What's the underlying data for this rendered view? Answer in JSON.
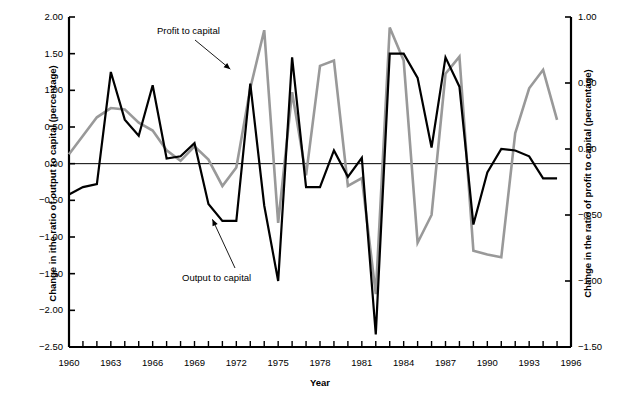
{
  "chart_data": {
    "type": "line",
    "title": "",
    "xlabel": "Year",
    "ylabel_left": "Change in ithe ratio of output to capital (percentage)",
    "ylabel_right": "Change in the ratio of profit to capital (percentage)",
    "x": [
      1960,
      1961,
      1962,
      1963,
      1964,
      1965,
      1966,
      1967,
      1968,
      1969,
      1970,
      1971,
      1972,
      1973,
      1974,
      1975,
      1976,
      1977,
      1978,
      1979,
      1980,
      1981,
      1982,
      1983,
      1984,
      1985,
      1986,
      1987,
      1988,
      1989,
      1990,
      1991,
      1992,
      1993,
      1994,
      1995
    ],
    "xlim": [
      1960,
      1996
    ],
    "xticks": [
      1960,
      1961,
      1962,
      1963,
      1964,
      1965,
      1966,
      1967,
      1968,
      1969,
      1970,
      1971,
      1972,
      1973,
      1974,
      1975,
      1976,
      1977,
      1978,
      1979,
      1980,
      1981,
      1982,
      1983,
      1984,
      1985,
      1986,
      1987,
      1988,
      1989,
      1990,
      1991,
      1992,
      1993,
      1994,
      1995,
      1996
    ],
    "xtick_labels": [
      "1960",
      "1963",
      "1966",
      "1969",
      "1972",
      "1975",
      "1978",
      "1981",
      "1984",
      "1987",
      "1990",
      "1993",
      "1996"
    ],
    "xtick_label_years": [
      1960,
      1963,
      1966,
      1969,
      1972,
      1975,
      1978,
      1981,
      1984,
      1987,
      1990,
      1993,
      1996
    ],
    "ylim_left": [
      -2.5,
      2.0
    ],
    "yticks_left": [
      2.0,
      1.5,
      1.0,
      0.5,
      0.0,
      -0.5,
      -1.0,
      -1.5,
      -2.0,
      -2.5
    ],
    "ytick_labels_left": [
      "2.00",
      "1.50",
      "1.00",
      "0.50",
      "0.00",
      "−0.50",
      "−1.00",
      "−1.50",
      "−2.00",
      "−2.50"
    ],
    "ylim_right": [
      -1.5,
      1.0
    ],
    "yticks_right": [
      1.0,
      0.5,
      0.0,
      -0.5,
      -1.0,
      -1.5
    ],
    "ytick_labels_right": [
      "1.00",
      "0.50",
      "0.00",
      "−0.50",
      "−1.00",
      "−1.50"
    ],
    "grid": false,
    "zero_line": true,
    "legend_position": "inline-annotations",
    "series": [
      {
        "name": "Output to capital",
        "axis": "left",
        "color": "#000000",
        "linewidth": 2.2,
        "values": [
          -0.42,
          -0.32,
          -0.28,
          1.25,
          0.6,
          0.38,
          1.07,
          0.07,
          0.1,
          0.28,
          -0.55,
          -0.78,
          -0.78,
          1.09,
          -0.57,
          -1.6,
          1.45,
          -0.32,
          -0.32,
          0.18,
          -0.18,
          0.08,
          -2.33,
          1.5,
          1.5,
          1.17,
          0.22,
          1.45,
          1.05,
          -0.83,
          -0.12,
          0.2,
          0.18,
          0.1,
          -0.2,
          -0.2
        ]
      },
      {
        "name": "Profit to capital",
        "axis": "right",
        "color": "#999999",
        "linewidth": 2.6,
        "values": [
          -0.04,
          0.1,
          0.24,
          0.31,
          0.3,
          0.2,
          0.14,
          -0.01,
          -0.09,
          0.02,
          -0.08,
          -0.28,
          -0.14,
          0.46,
          0.9,
          -0.56,
          0.43,
          -0.2,
          0.63,
          0.67,
          -0.28,
          -0.22,
          -1.1,
          0.92,
          0.67,
          -0.71,
          -0.5,
          0.57,
          0.7,
          -0.77,
          -0.8,
          -0.82,
          0.12,
          0.46,
          0.6,
          0.22
        ]
      }
    ],
    "annotations": [
      {
        "name": "Profit to capital",
        "text": "Profit to capital",
        "points_to_year": 1972,
        "points_to_value": 0.62
      },
      {
        "name": "Output to capital",
        "text": "Output to capital",
        "points_to_year": 1970,
        "points_to_value": -0.8
      }
    ]
  }
}
